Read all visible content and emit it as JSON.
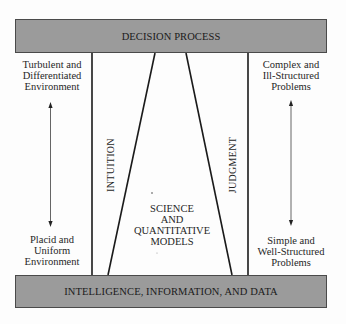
{
  "diagram": {
    "top_box": {
      "label": "DECISION PROCESS"
    },
    "bottom_box": {
      "label": "INTELLIGENCE, INFORMATION, AND DATA"
    },
    "left_column": {
      "top_label": [
        "Turbulent and",
        "Differentiated",
        "Environment"
      ],
      "bottom_label": [
        "Placid and",
        "Uniform",
        "Environment"
      ],
      "arrow": "double-headed-vertical"
    },
    "right_column": {
      "top_label": [
        "Complex and",
        "Ill-Structured",
        "Problems"
      ],
      "bottom_label": [
        "Simple and",
        "Well-Structured",
        "Problems"
      ],
      "arrow": "double-headed-vertical"
    },
    "regions": {
      "left": "INTUITION",
      "right": "JUDGMENT",
      "center": [
        "SCIENCE",
        "AND",
        "QUANTITATIVE",
        "MODELS"
      ]
    },
    "colors": {
      "box_fill": "#9b9b9b",
      "line": "#1a1a1a",
      "text": "#262626",
      "background": "#fdfdfd"
    }
  }
}
